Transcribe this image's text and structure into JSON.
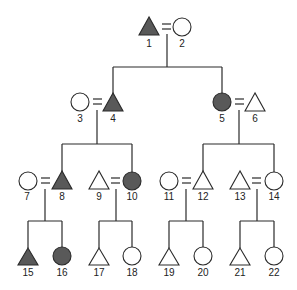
{
  "diagram": {
    "type": "kinship-pedigree",
    "colors": {
      "filled": "#595959",
      "empty": "#ffffff",
      "stroke": "#2a2a2a"
    },
    "individuals": [
      {
        "id": "1",
        "sex": "male",
        "filled": true
      },
      {
        "id": "2",
        "sex": "female",
        "filled": false
      },
      {
        "id": "3",
        "sex": "female",
        "filled": false
      },
      {
        "id": "4",
        "sex": "male",
        "filled": true
      },
      {
        "id": "5",
        "sex": "female",
        "filled": true
      },
      {
        "id": "6",
        "sex": "male",
        "filled": false
      },
      {
        "id": "7",
        "sex": "female",
        "filled": false
      },
      {
        "id": "8",
        "sex": "male",
        "filled": true
      },
      {
        "id": "9",
        "sex": "male",
        "filled": false
      },
      {
        "id": "10",
        "sex": "female",
        "filled": true
      },
      {
        "id": "11",
        "sex": "female",
        "filled": false
      },
      {
        "id": "12",
        "sex": "male",
        "filled": false
      },
      {
        "id": "13",
        "sex": "male",
        "filled": false
      },
      {
        "id": "14",
        "sex": "female",
        "filled": false
      },
      {
        "id": "15",
        "sex": "male",
        "filled": true
      },
      {
        "id": "16",
        "sex": "female",
        "filled": true
      },
      {
        "id": "17",
        "sex": "male",
        "filled": false
      },
      {
        "id": "18",
        "sex": "female",
        "filled": false
      },
      {
        "id": "19",
        "sex": "male",
        "filled": false
      },
      {
        "id": "20",
        "sex": "female",
        "filled": false
      },
      {
        "id": "21",
        "sex": "male",
        "filled": false
      },
      {
        "id": "22",
        "sex": "female",
        "filled": false
      }
    ],
    "marriages": [
      [
        "1",
        "2"
      ],
      [
        "3",
        "4"
      ],
      [
        "5",
        "6"
      ],
      [
        "7",
        "8"
      ],
      [
        "9",
        "10"
      ],
      [
        "11",
        "12"
      ],
      [
        "13",
        "14"
      ]
    ],
    "descent": [
      {
        "parents": [
          "1",
          "2"
        ],
        "children": [
          "4",
          "5"
        ]
      },
      {
        "parents": [
          "3",
          "4"
        ],
        "children": [
          "8",
          "10"
        ]
      },
      {
        "parents": [
          "5",
          "6"
        ],
        "children": [
          "12",
          "14"
        ]
      },
      {
        "parents": [
          "7",
          "8"
        ],
        "children": [
          "15",
          "16"
        ]
      },
      {
        "parents": [
          "9",
          "10"
        ],
        "children": [
          "17",
          "18"
        ]
      },
      {
        "parents": [
          "11",
          "12"
        ],
        "children": [
          "19",
          "20"
        ]
      },
      {
        "parents": [
          "13",
          "14"
        ],
        "children": [
          "21",
          "22"
        ]
      }
    ],
    "labels": {
      "p1": "1",
      "p2": "2",
      "p3": "3",
      "p4": "4",
      "p5": "5",
      "p6": "6",
      "p7": "7",
      "p8": "8",
      "p9": "9",
      "p10": "10",
      "p11": "11",
      "p12": "12",
      "p13": "13",
      "p14": "14",
      "p15": "15",
      "p16": "16",
      "p17": "17",
      "p18": "18",
      "p19": "19",
      "p20": "20",
      "p21": "21",
      "p22": "22"
    }
  }
}
